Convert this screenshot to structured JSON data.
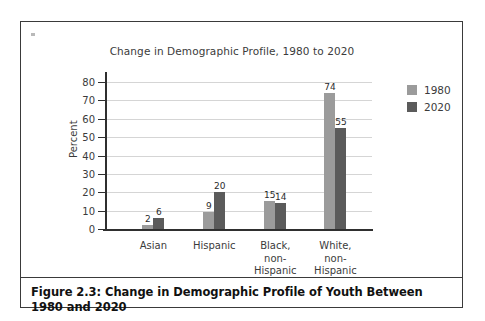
{
  "figure": {
    "caption": "Figure 2.3: Change in Demographic Profile of Youth Between 1980 and 2020"
  },
  "chart_data": {
    "type": "bar",
    "title": "Change in Demographic Profile, 1980 to 2020",
    "xlabel": "",
    "ylabel": "Percent",
    "ylim": [
      0,
      80
    ],
    "yticks": [
      0,
      10,
      20,
      30,
      40,
      50,
      60,
      70,
      80
    ],
    "ytick_labels": [
      "0",
      "10",
      "20",
      "30",
      "40",
      "50",
      "60",
      "70",
      "80"
    ],
    "grid": "horizontal",
    "legend_position": "right",
    "categories": [
      "Asian",
      "Hispanic",
      "Black,\nnon-\nHispanic",
      "White,\nnon-\nHispanic"
    ],
    "series": [
      {
        "name": "1980",
        "color": "#9b9b9b",
        "values": [
          2,
          9,
          15,
          74
        ],
        "labels": [
          "2",
          "9",
          "15",
          "74"
        ]
      },
      {
        "name": "2020",
        "color": "#5b5b5b",
        "values": [
          6,
          20,
          14,
          55
        ],
        "labels": [
          "6",
          "20",
          "14",
          "55"
        ]
      }
    ]
  }
}
